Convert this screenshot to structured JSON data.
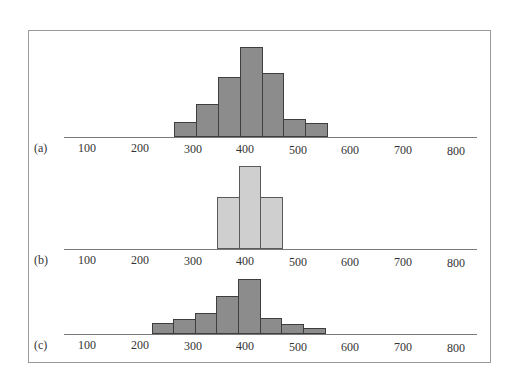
{
  "chart_data": [
    {
      "type": "bar",
      "title": "(a)",
      "panel_label": "(a)",
      "xlabel": "",
      "ylabel": "",
      "x_ticks": [
        "100",
        "200",
        "300",
        "400",
        "500",
        "600",
        "700",
        "800"
      ],
      "xlim": [
        60,
        840
      ],
      "bin_width": 40,
      "categories": [
        "260-300",
        "300-340",
        "340-380",
        "380-420",
        "420-460",
        "460-500",
        "500-540"
      ],
      "values": [
        14,
        32,
        59,
        89,
        63,
        17,
        13
      ],
      "fill_color": "#8c8c8c",
      "grid": false
    },
    {
      "type": "bar",
      "title": "(b)",
      "panel_label": "(b)",
      "xlabel": "",
      "ylabel": "",
      "x_ticks": [
        "100",
        "200",
        "300",
        "400",
        "500",
        "600",
        "700",
        "800"
      ],
      "xlim": [
        60,
        840
      ],
      "bin_width": 40,
      "categories": [
        "340-380",
        "380-420",
        "420-460"
      ],
      "values": [
        51,
        82,
        51
      ],
      "fill_color": "#cfcfcf",
      "grid": false
    },
    {
      "type": "bar",
      "title": "(c)",
      "panel_label": "(c)",
      "xlabel": "",
      "ylabel": "",
      "x_ticks": [
        "100",
        "200",
        "300",
        "400",
        "500",
        "600",
        "700",
        "800"
      ],
      "xlim": [
        60,
        840
      ],
      "bin_width": 40,
      "categories": [
        "220-260",
        "260-300",
        "300-340",
        "340-380",
        "380-420",
        "420-460",
        "460-500",
        "500-540"
      ],
      "values": [
        10,
        14,
        20,
        37,
        54,
        15,
        9,
        5
      ],
      "fill_color": "#8c8c8c",
      "grid": false
    }
  ],
  "panels": [
    {
      "label": "(a)",
      "baseline": 136,
      "style": "dark",
      "bins": [
        {
          "left": 174,
          "width": 22,
          "h": 14
        },
        {
          "left": 196,
          "width": 22,
          "h": 32
        },
        {
          "left": 218,
          "width": 22,
          "h": 59
        },
        {
          "left": 240,
          "width": 22,
          "h": 89
        },
        {
          "left": 262,
          "width": 21,
          "h": 63
        },
        {
          "left": 283,
          "width": 22,
          "h": 17
        },
        {
          "left": 305,
          "width": 22,
          "h": 13
        }
      ]
    },
    {
      "label": "(b)",
      "baseline": 248,
      "style": "light",
      "bins": [
        {
          "left": 217,
          "width": 22,
          "h": 51
        },
        {
          "left": 239,
          "width": 21,
          "h": 82
        },
        {
          "left": 260,
          "width": 22,
          "h": 51
        }
      ]
    },
    {
      "label": "(c)",
      "baseline": 333,
      "style": "dark",
      "bins": [
        {
          "left": 152,
          "width": 21,
          "h": 10
        },
        {
          "left": 173,
          "width": 22,
          "h": 14
        },
        {
          "left": 195,
          "width": 21,
          "h": 20
        },
        {
          "left": 216,
          "width": 22,
          "h": 37
        },
        {
          "left": 238,
          "width": 22,
          "h": 54
        },
        {
          "left": 260,
          "width": 21,
          "h": 15
        },
        {
          "left": 281,
          "width": 22,
          "h": 9
        },
        {
          "left": 303,
          "width": 22,
          "h": 5
        }
      ]
    }
  ],
  "tick_positions": [
    87,
    140,
    193,
    245,
    298,
    350,
    403,
    456
  ]
}
